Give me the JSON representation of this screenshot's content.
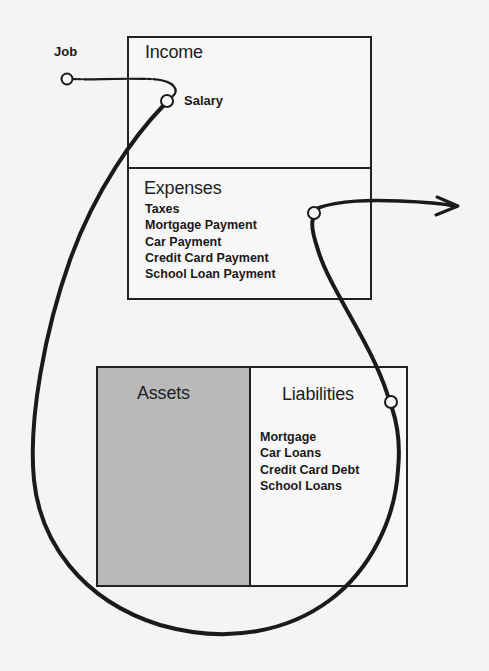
{
  "diagram": {
    "source_node": {
      "label": "Job"
    },
    "income": {
      "title": "Income",
      "items": [
        "Salary"
      ]
    },
    "expenses": {
      "title": "Expenses",
      "items": [
        "Taxes",
        "Mortgage Payment",
        "Car Payment",
        "Credit Card Payment",
        "School Loan Payment"
      ]
    },
    "assets": {
      "title": "Assets",
      "fill_color": "#b9b9b9"
    },
    "liabilities": {
      "title": "Liabilities",
      "items": [
        "Mortgage",
        "Car Loans",
        "Credit Card Debt",
        "School Loans"
      ]
    },
    "flow": {
      "description": "Cash flows from Job to Salary, loops around through Liabilities, into Expenses and exits to the right",
      "stroke_color": "#1a1a1a"
    },
    "colors": {
      "background": "#f4f4f4",
      "border": "#222222",
      "assets_fill": "#b9b9b9"
    }
  }
}
